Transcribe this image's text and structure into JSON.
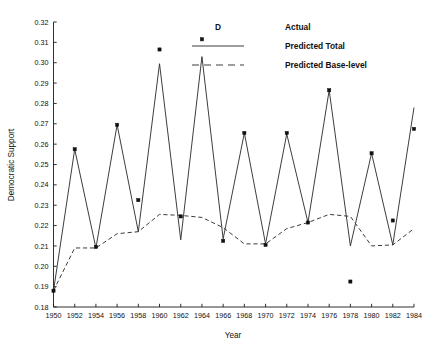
{
  "chart_data": {
    "type": "line",
    "title": "",
    "xlabel": "Year",
    "ylabel": "Democratic Support",
    "xlim": [
      1950,
      1984
    ],
    "ylim": [
      0.18,
      0.32
    ],
    "grid": false,
    "legend_position": "top-right",
    "x_ticks": [
      1950,
      1952,
      1954,
      1956,
      1958,
      1960,
      1962,
      1964,
      1966,
      1968,
      1970,
      1972,
      1974,
      1976,
      1978,
      1980,
      1982,
      1984
    ],
    "x_tick_labels": [
      "1950",
      "1952",
      "1954",
      "1956",
      "1958",
      "1960",
      "1962",
      "1964",
      "1966",
      "1968",
      "1970",
      "1972",
      "1974",
      "1976",
      "1978",
      "1980",
      "1982",
      "1984"
    ],
    "y_ticks": [
      0.18,
      0.19,
      0.2,
      0.21,
      0.22,
      0.23,
      0.24,
      0.25,
      0.26,
      0.27,
      0.28,
      0.29,
      0.3,
      0.31,
      0.32
    ],
    "y_tick_labels": [
      "0.18",
      "0.19",
      "0.20",
      "0.21",
      "0.22",
      "0.23",
      "0.24",
      "0.25",
      "0.26",
      "0.27",
      "0.28",
      "0.29",
      "0.30",
      "0.31",
      "0.32"
    ],
    "x": [
      1950,
      1952,
      1954,
      1956,
      1958,
      1960,
      1962,
      1964,
      1966,
      1968,
      1970,
      1972,
      1974,
      1976,
      1978,
      1980,
      1982,
      1984
    ],
    "series": [
      {
        "name": "Actual",
        "marker": "square",
        "style": "markers",
        "values": [
          0.188,
          0.2575,
          0.2095,
          0.2695,
          0.2325,
          0.3065,
          0.2245,
          0.3115,
          0.2125,
          0.2655,
          0.2105,
          0.2655,
          0.2215,
          0.2865,
          0.1925,
          0.2555,
          0.2225,
          0.2675
        ]
      },
      {
        "name": "Predicted Total",
        "style": "solid-line",
        "values": [
          0.188,
          0.2575,
          0.209,
          0.2695,
          0.217,
          0.2995,
          0.213,
          0.303,
          0.2135,
          0.2655,
          0.211,
          0.265,
          0.2215,
          0.2865,
          0.21,
          0.2555,
          0.2105,
          0.278
        ]
      },
      {
        "name": "Predicted Base-level",
        "style": "dashed-line",
        "values": [
          0.188,
          0.209,
          0.209,
          0.216,
          0.217,
          0.2255,
          0.225,
          0.224,
          0.219,
          0.211,
          0.211,
          0.2185,
          0.2215,
          0.2255,
          0.2245,
          0.21,
          0.2105,
          0.2185
        ]
      }
    ],
    "legend": [
      {
        "label": "Actual",
        "marker": "square-glyph",
        "glyph": "D"
      },
      {
        "label": "Predicted Total",
        "marker": "solid-line"
      },
      {
        "label": "Predicted Base-level",
        "marker": "dashed-line"
      }
    ]
  },
  "colors": {
    "axis": "#1a1a1a",
    "line": "#333333",
    "marker": "#111111",
    "background": "#ffffff"
  }
}
